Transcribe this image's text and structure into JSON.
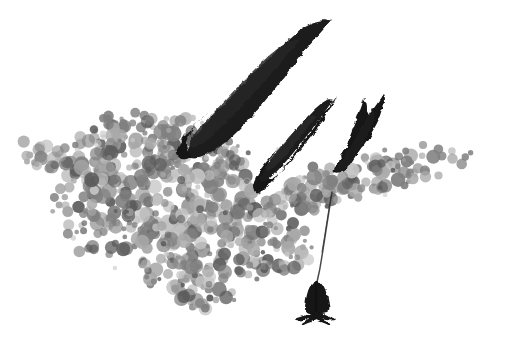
{
  "artwork": {
    "title": "Ink and stipple illustration of winged form with hanging pendant",
    "medium": "brush-and-ink with stippled wash",
    "palette": {
      "background": "#ffffff",
      "ink_black": "#161616",
      "ink_black_soft": "#232323",
      "stipple_dark": "#5c5c5c",
      "stipple_mid": "#808080",
      "stipple_light": "#a9a9a9",
      "stipple_pale": "#c4c4c4",
      "thread": "#3a3a3a"
    },
    "canvas": {
      "width": 505,
      "height": 352
    }
  },
  "elements": {
    "stipple_cloud": {
      "name": "Stippled grayscale cloud mass",
      "description": "Dense field of overlapping circular blobs forming a wide horizontal band that tapers into thin tendrils at left and right and sags downward at center-left",
      "bounds": {
        "x": 18,
        "y": 108,
        "width": 462,
        "height": 205
      },
      "blob_count": 760,
      "blob_radius_range": [
        2.0,
        7.5
      ]
    },
    "wing_large": {
      "name": "Large ink feather stroke",
      "description": "Tall curved black brushstroke, broad at lower-left, tapering to a fine point at upper-right",
      "tip": {
        "x": 332,
        "y": 20
      },
      "base": {
        "x": 186,
        "y": 152
      }
    },
    "wing_middle": {
      "name": "Middle ink feather stroke",
      "description": "Medium black brushstroke, pointed tip upper-right, blunt tail lower-left",
      "tip": {
        "x": 337,
        "y": 96
      },
      "base": {
        "x": 263,
        "y": 193
      }
    },
    "wing_small": {
      "name": "Small forked ink feather stroke",
      "description": "Narrow black brushstroke with a split double point at the top",
      "tip": {
        "x": 383,
        "y": 95
      },
      "base": {
        "x": 345,
        "y": 172
      }
    },
    "thread": {
      "name": "Hanging thread",
      "description": "Thin tapering line descending from the cloud down to the pendant figure",
      "from": {
        "x": 332,
        "y": 192
      },
      "to": {
        "x": 317,
        "y": 282
      }
    },
    "pendant_figure": {
      "name": "Suspended bell figure",
      "description": "Small dark bell or robed figure with a splayed foot base, hanging at the bottom of the thread",
      "center": {
        "x": 316,
        "y": 297
      },
      "width": 22,
      "height": 38
    },
    "stray_blob": {
      "name": "Isolated stipple blob",
      "description": "Single detached dark dot below the cloud near the thread",
      "center": {
        "x": 293,
        "y": 223
      },
      "radius": 6
    }
  }
}
